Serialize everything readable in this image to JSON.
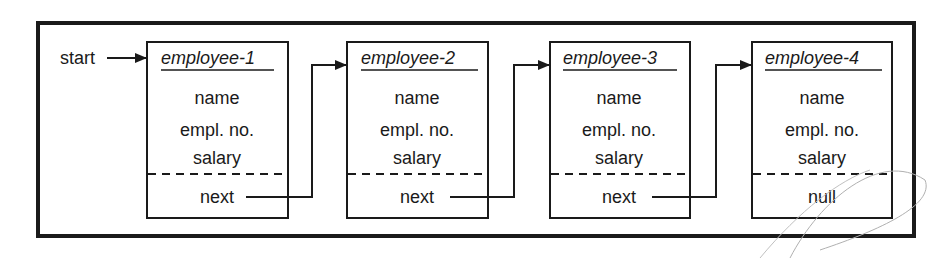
{
  "diagram": {
    "start_label": "start",
    "colors": {
      "ink": "#1a1a1a",
      "background": "#ffffff",
      "pencil": "#9a9a9a"
    },
    "nodes": [
      {
        "title": "employee-1",
        "fields": [
          "name",
          "empl. no.",
          "salary"
        ],
        "link": "next"
      },
      {
        "title": "employee-2",
        "fields": [
          "name",
          "empl. no.",
          "salary"
        ],
        "link": "next"
      },
      {
        "title": "employee-3",
        "fields": [
          "name",
          "empl. no.",
          "salary"
        ],
        "link": "next"
      },
      {
        "title": "employee-4",
        "fields": [
          "name",
          "empl. no.",
          "salary"
        ],
        "link": "null"
      }
    ]
  }
}
